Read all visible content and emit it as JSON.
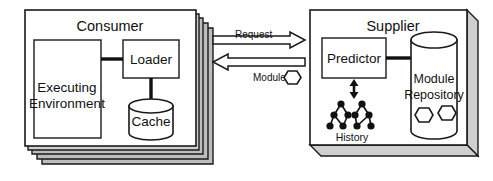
{
  "diagram": {
    "background": "#ffffff",
    "ink": "#111111",
    "shadow": "#cfcfcf"
  },
  "consumer": {
    "title": "Consumer",
    "stack_count": 4,
    "executing_environment": {
      "line1": "Executing",
      "line2": "Environment"
    },
    "loader": {
      "label": "Loader"
    },
    "cache": {
      "label": "Cache"
    }
  },
  "channel": {
    "request": {
      "label": "Request",
      "direction": "right"
    },
    "module": {
      "label": "Module",
      "direction": "left",
      "icon": "module-hexagon-icon"
    }
  },
  "supplier": {
    "title": "Supplier",
    "predictor": {
      "label": "Predictor"
    },
    "history": {
      "label": "History",
      "icon": "history-tree-icon",
      "node_count": 9
    },
    "module_repository": {
      "line1": "Module",
      "line2": "Repository",
      "module_icons": 2
    },
    "link": {
      "icon": "double-headed-arrow-icon"
    }
  }
}
